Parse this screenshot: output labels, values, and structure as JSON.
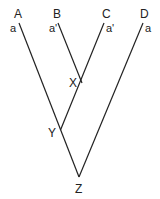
{
  "diagram": {
    "type": "phylogenetic-tree",
    "colors": {
      "line": "#222222",
      "text": "#222222",
      "background": "#ffffff"
    },
    "leaves": [
      {
        "id": "A",
        "label": "A",
        "allele": "a"
      },
      {
        "id": "B",
        "label": "B",
        "allele": "a'"
      },
      {
        "id": "C",
        "label": "C",
        "allele": "a'"
      },
      {
        "id": "D",
        "label": "D",
        "allele": "a"
      }
    ],
    "internal_nodes": [
      {
        "id": "X",
        "label": "X",
        "children": [
          "B",
          "C"
        ]
      },
      {
        "id": "Y",
        "label": "Y",
        "children": [
          "A",
          "X"
        ]
      },
      {
        "id": "Z",
        "label": "Z",
        "children": [
          "Y",
          "D"
        ]
      }
    ]
  }
}
